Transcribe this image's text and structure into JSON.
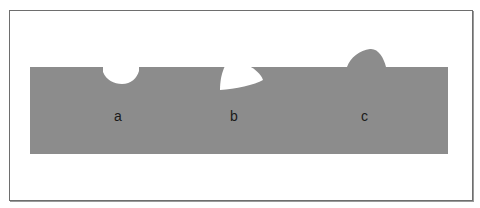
{
  "diagram": {
    "colors": {
      "background": "#ffffff",
      "frame": "#6e6e6e",
      "surface": "#8c8c8c",
      "defect_void": "#ffffff"
    },
    "labels": [
      {
        "id": "a",
        "text": "a",
        "x": 114,
        "y": 108
      },
      {
        "id": "b",
        "text": "b",
        "x": 230,
        "y": 108
      },
      {
        "id": "c",
        "text": "c",
        "x": 361,
        "y": 108
      }
    ]
  }
}
